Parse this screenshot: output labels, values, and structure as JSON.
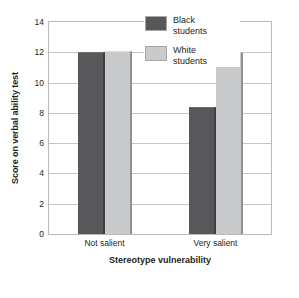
{
  "chart_data": {
    "type": "bar",
    "title": "",
    "subtitle": "",
    "xlabel": "Stereotype vulnerability",
    "ylabel": "Score on verbal ability test",
    "categories": [
      "Not salient",
      "Very salient"
    ],
    "series": [
      {
        "name": "Black students",
        "values": [
          12.0,
          8.4
        ],
        "color": "#58585a"
      },
      {
        "name": "White students",
        "values": [
          12.1,
          12.0
        ],
        "color": "#c9cacb"
      }
    ],
    "ylim": [
      0,
      14
    ],
    "yticks": [
      0,
      2,
      4,
      6,
      8,
      10,
      12,
      14
    ],
    "ytick_labels": [
      "0",
      "2",
      "4",
      "6",
      "8",
      "10",
      "12",
      "14"
    ],
    "grid": true,
    "grid_axis": "y",
    "legend_position": "top-center",
    "legend_entries": [
      "Black\nstudents",
      "White\nstudents"
    ]
  },
  "axes": {
    "y_title": "Score on verbal ability test",
    "x_title": "Stereotype vulnerability"
  },
  "legend": {
    "items": [
      {
        "label": "Black\nstudents",
        "swatch": "dark"
      },
      {
        "label": "White\nstudents",
        "swatch": "light"
      }
    ]
  },
  "caption": {
    "text": ""
  },
  "colors": {
    "bar_dark": "#58585a",
    "bar_light": "#c9cacb",
    "gridline": "#c4c4c4",
    "plot_border": "#b9b9b9",
    "text": "#231f20",
    "background": "#ffffff"
  }
}
